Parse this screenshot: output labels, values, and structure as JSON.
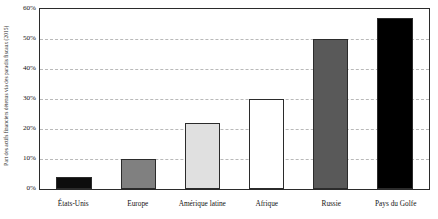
{
  "chart_data": {
    "type": "bar",
    "title": "",
    "xlabel": "",
    "ylabel": "Part des actifs financiers détenus via des paradis fiscaux (2015)",
    "categories": [
      "États-Unis",
      "Europe",
      "Amérique latine",
      "Afrique",
      "Russie",
      "Pays du Golfe"
    ],
    "values": [
      4,
      10,
      22,
      30,
      50,
      57
    ],
    "value_labels": [
      "4%",
      "10%",
      "22%",
      "30%",
      "50%",
      "57%"
    ],
    "bar_colors": [
      "#0d0d0d",
      "#808080",
      "#e0e0e0",
      "#ffffff",
      "#595959",
      "#000000"
    ],
    "bar_edge_color": "#2b2b2b",
    "ylim": [
      0,
      60
    ],
    "ytick_values": [
      0,
      10,
      20,
      30,
      40,
      50,
      60
    ],
    "ytick_labels": [
      "0%",
      "10%",
      "20%",
      "30%",
      "40%",
      "50%",
      "60%"
    ],
    "grid": true,
    "grid_axis": "y",
    "grid_color": "#b9b9b9",
    "grid_style": "dashed",
    "legend": "none",
    "frame_color": "#2b2b2b",
    "background": "#ffffff"
  }
}
